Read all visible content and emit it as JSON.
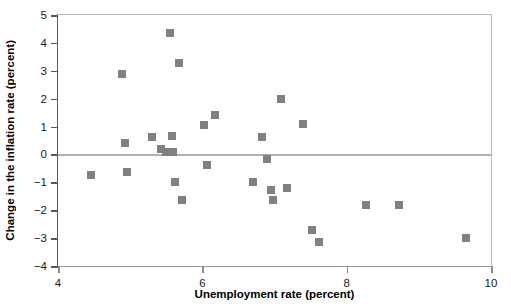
{
  "chart_data": {
    "type": "scatter",
    "title": "",
    "xlabel": "Unemployment rate (percent)",
    "ylabel": "Change in the inflation rate (percent)",
    "xlim": [
      4,
      10
    ],
    "ylim": [
      -4,
      5
    ],
    "xticks": [
      4,
      6,
      8,
      10
    ],
    "yticks": [
      5,
      4,
      3,
      2,
      1,
      0,
      -1,
      -2,
      -3,
      -4
    ],
    "xtick_labels": [
      "4",
      "6",
      "8",
      "10"
    ],
    "ytick_labels": [
      "5",
      "4",
      "3",
      "2",
      "1",
      "0",
      "−1",
      "−2",
      "−3",
      "−4"
    ],
    "grid": false,
    "legend": null,
    "marker": {
      "shape": "square",
      "color": "#808080",
      "size_px": 8
    },
    "reference_lines": [
      {
        "name": "zero-line",
        "axis": "y",
        "value": 0,
        "color": "#b0b0b0"
      }
    ],
    "points": [
      {
        "x": 4.46,
        "y": -0.75
      },
      {
        "x": 4.88,
        "y": 2.87
      },
      {
        "x": 4.93,
        "y": 0.4
      },
      {
        "x": 4.96,
        "y": -0.62
      },
      {
        "x": 5.3,
        "y": 0.62
      },
      {
        "x": 5.43,
        "y": 0.18
      },
      {
        "x": 5.5,
        "y": 0.1
      },
      {
        "x": 5.55,
        "y": 4.36
      },
      {
        "x": 5.58,
        "y": 0.65
      },
      {
        "x": 5.6,
        "y": 0.1
      },
      {
        "x": 5.62,
        "y": -0.98
      },
      {
        "x": 5.68,
        "y": 3.27
      },
      {
        "x": 5.72,
        "y": -1.62
      },
      {
        "x": 6.03,
        "y": 1.07
      },
      {
        "x": 6.06,
        "y": -0.38
      },
      {
        "x": 6.17,
        "y": 1.4
      },
      {
        "x": 6.7,
        "y": -0.98
      },
      {
        "x": 6.82,
        "y": 0.63
      },
      {
        "x": 6.9,
        "y": -0.18
      },
      {
        "x": 6.95,
        "y": -1.28
      },
      {
        "x": 6.98,
        "y": -1.65
      },
      {
        "x": 7.09,
        "y": 1.98
      },
      {
        "x": 7.18,
        "y": -1.2
      },
      {
        "x": 7.4,
        "y": 1.1
      },
      {
        "x": 7.52,
        "y": -2.72
      },
      {
        "x": 7.62,
        "y": -3.13
      },
      {
        "x": 8.27,
        "y": -1.8
      },
      {
        "x": 8.73,
        "y": -1.83
      },
      {
        "x": 9.65,
        "y": -2.98
      }
    ]
  }
}
